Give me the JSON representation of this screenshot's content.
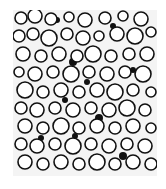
{
  "image": {
    "description": "Black and white micrograph of densely packed round bubbles/cells",
    "colors": {
      "background": "#ffffff",
      "field": "#f4f4f4",
      "outline": "#111111"
    }
  },
  "bubbles": [
    [
      8,
      8,
      6
    ],
    [
      22,
      6,
      7
    ],
    [
      38,
      9,
      6
    ],
    [
      56,
      7,
      5
    ],
    [
      72,
      10,
      7
    ],
    [
      92,
      8,
      6
    ],
    [
      110,
      6,
      5
    ],
    [
      128,
      9,
      7
    ],
    [
      6,
      26,
      6
    ],
    [
      20,
      24,
      6
    ],
    [
      36,
      28,
      8
    ],
    [
      54,
      24,
      6
    ],
    [
      70,
      28,
      7
    ],
    [
      86,
      26,
      5
    ],
    [
      104,
      24,
      7
    ],
    [
      122,
      26,
      8
    ],
    [
      138,
      22,
      5
    ],
    [
      10,
      44,
      7
    ],
    [
      28,
      46,
      6
    ],
    [
      46,
      44,
      7
    ],
    [
      64,
      46,
      6
    ],
    [
      80,
      44,
      8
    ],
    [
      98,
      46,
      6
    ],
    [
      116,
      44,
      6
    ],
    [
      134,
      44,
      7
    ],
    [
      6,
      62,
      5
    ],
    [
      22,
      64,
      7
    ],
    [
      40,
      62,
      6
    ],
    [
      58,
      64,
      8
    ],
    [
      76,
      62,
      6
    ],
    [
      94,
      64,
      7
    ],
    [
      112,
      62,
      6
    ],
    [
      130,
      64,
      8
    ],
    [
      12,
      80,
      8
    ],
    [
      30,
      82,
      6
    ],
    [
      48,
      80,
      7
    ],
    [
      66,
      82,
      6
    ],
    [
      84,
      80,
      7
    ],
    [
      102,
      82,
      8
    ],
    [
      120,
      80,
      6
    ],
    [
      138,
      82,
      5
    ],
    [
      8,
      98,
      6
    ],
    [
      24,
      100,
      7
    ],
    [
      42,
      98,
      6
    ],
    [
      60,
      100,
      7
    ],
    [
      78,
      98,
      6
    ],
    [
      96,
      100,
      7
    ],
    [
      114,
      98,
      8
    ],
    [
      132,
      100,
      6
    ],
    [
      12,
      116,
      7
    ],
    [
      30,
      118,
      6
    ],
    [
      48,
      116,
      8
    ],
    [
      66,
      118,
      6
    ],
    [
      84,
      116,
      7
    ],
    [
      102,
      118,
      6
    ],
    [
      120,
      116,
      7
    ],
    [
      138,
      118,
      5
    ],
    [
      8,
      134,
      6
    ],
    [
      24,
      136,
      7
    ],
    [
      42,
      134,
      6
    ],
    [
      60,
      136,
      8
    ],
    [
      78,
      134,
      6
    ],
    [
      96,
      136,
      7
    ],
    [
      114,
      134,
      6
    ],
    [
      132,
      136,
      7
    ],
    [
      12,
      152,
      7
    ],
    [
      30,
      154,
      6
    ],
    [
      48,
      152,
      7
    ],
    [
      66,
      154,
      6
    ],
    [
      84,
      152,
      8
    ],
    [
      102,
      154,
      6
    ],
    [
      120,
      152,
      7
    ],
    [
      138,
      154,
      6
    ]
  ],
  "dark_spots": [
    [
      44,
      10,
      3
    ],
    [
      100,
      16,
      3
    ],
    [
      60,
      52,
      4
    ],
    [
      74,
      72,
      3
    ],
    [
      52,
      90,
      3
    ],
    [
      86,
      108,
      4
    ],
    [
      62,
      126,
      3
    ],
    [
      110,
      146,
      4
    ],
    [
      28,
      128,
      3
    ],
    [
      120,
      60,
      3
    ]
  ]
}
